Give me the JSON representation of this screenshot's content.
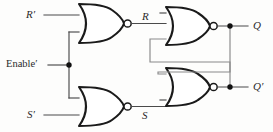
{
  "diagram": {
    "type": "logic-circuit-schematic",
    "colors": {
      "background": "#fdfdfc",
      "gate_outline": "#1a1a1a",
      "gate_fill": "#ffffff",
      "wire": "#4a4a4a",
      "feedback_wire": "#8a8a8a",
      "junction": "#111111",
      "label": "#2a2a2a"
    },
    "labels": {
      "input_r_not": "R′",
      "input_enable_not": "Enable′",
      "input_s_not": "S′",
      "node_r": "R",
      "node_s": "S",
      "output_q": "Q",
      "output_q_not": "Q′"
    },
    "gates": [
      {
        "name": "nor-gate-top-left",
        "function": "NOR",
        "inputs": [
          "R′",
          "Enable′"
        ],
        "output": "R"
      },
      {
        "name": "nor-gate-bottom-left",
        "function": "NOR",
        "inputs": [
          "Enable′",
          "S′"
        ],
        "output": "S"
      },
      {
        "name": "nor-gate-top-right",
        "function": "NOR",
        "inputs": [
          "R",
          "Q′"
        ],
        "output": "Q"
      },
      {
        "name": "nor-gate-bottom-right",
        "function": "NOR",
        "inputs": [
          "Q",
          "S"
        ],
        "output": "Q′"
      }
    ],
    "junctions": [
      {
        "name": "junction-enable",
        "signal": "Enable′"
      },
      {
        "name": "junction-q",
        "signal": "Q"
      },
      {
        "name": "junction-q-not",
        "signal": "Q′"
      }
    ],
    "nets": [
      {
        "name": "net-r-not",
        "from": "R′",
        "to": "nor-gate-top-left.in1"
      },
      {
        "name": "net-enable-not",
        "from": "Enable′",
        "to": "nor-gate-top-left.in2 and nor-gate-bottom-left.in1"
      },
      {
        "name": "net-s-not",
        "from": "S′",
        "to": "nor-gate-bottom-left.in2"
      },
      {
        "name": "net-r",
        "from": "nor-gate-top-left.out",
        "to": "nor-gate-top-right.in1"
      },
      {
        "name": "net-s",
        "from": "nor-gate-bottom-left.out",
        "to": "nor-gate-bottom-right.in2"
      },
      {
        "name": "net-q-feedback",
        "from": "junction-q",
        "to": "nor-gate-bottom-right.in1"
      },
      {
        "name": "net-q-not-feedback",
        "from": "junction-q-not",
        "to": "nor-gate-top-right.in2"
      }
    ]
  }
}
